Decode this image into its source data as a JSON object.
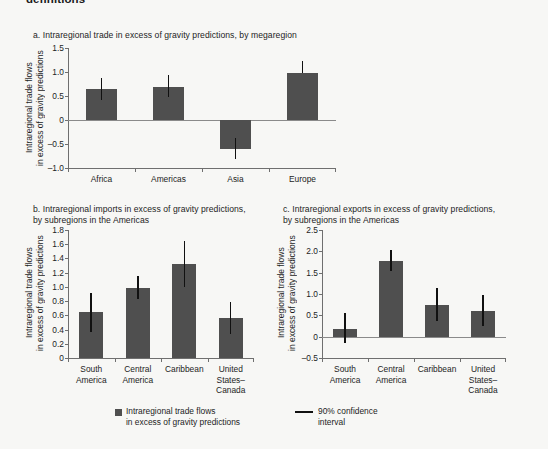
{
  "page": {
    "clipped_heading": "definitions",
    "background": "#f7f7f5",
    "bar_color": "#4f4f4f",
    "error_color": "#111111",
    "axis_color": "#6f6f6f"
  },
  "legend": {
    "bar_label": "Intraregional trade flows\nin excess of gravity predictions",
    "ci_label": "90% confidence\ninterval",
    "swatch_bar_name": "bar-swatch",
    "swatch_line_name": "ci-line-swatch"
  },
  "chart_data": [
    {
      "id": "a",
      "type": "bar",
      "title": "a. Intraregional trade in excess of gravity predictions, by megaregion",
      "xlabel": "",
      "ylabel": "Intraregional trade flows\nin excess of gravity predictions",
      "categories": [
        "Africa",
        "Americas",
        "Asia",
        "Europe"
      ],
      "values": [
        0.64,
        0.69,
        -0.6,
        0.97
      ],
      "ci_low": [
        0.41,
        0.48,
        -0.82,
        0.97
      ],
      "ci_high": [
        0.88,
        0.93,
        -0.38,
        1.22
      ],
      "yticks": [
        1.5,
        1.0,
        0.5,
        0,
        -0.5,
        -1.0
      ],
      "ytick_labels": [
        "1.5",
        "1.0",
        "0.5",
        "0",
        "–0.5",
        "–1.0"
      ],
      "ylim": [
        -1.0,
        1.5
      ],
      "grid": false,
      "legend_position": "bottom",
      "error_label": "90% confidence interval"
    },
    {
      "id": "b",
      "type": "bar",
      "title": "b. Intraregional imports in excess of gravity predictions,\nby subregions in the Americas",
      "xlabel": "",
      "ylabel": "Intraregional trade flows\nin excess of gravity predictions",
      "categories": [
        "South\nAmerica",
        "Central\nAmerica",
        "Caribbean",
        "United\nStates–\nCanada"
      ],
      "values": [
        0.65,
        0.99,
        1.32,
        0.56
      ],
      "ci_low": [
        0.36,
        0.83,
        1.0,
        0.34
      ],
      "ci_high": [
        0.92,
        1.15,
        1.65,
        0.79
      ],
      "yticks": [
        1.8,
        1.6,
        1.4,
        1.2,
        1.0,
        0.8,
        0.6,
        0.4,
        0.2,
        0
      ],
      "ytick_labels": [
        "1.8",
        "1.6",
        "1.4",
        "1.2",
        "1.0",
        "0.8",
        "0.6",
        "0.4",
        "0.2",
        "0"
      ],
      "ylim": [
        0,
        1.8
      ],
      "grid": false,
      "legend_position": "bottom",
      "error_label": "90% confidence interval"
    },
    {
      "id": "c",
      "type": "bar",
      "title": "c. Intraregional exports in excess of gravity predictions,\nby subregions in the Americas",
      "xlabel": "",
      "ylabel": "Intraregional trade flows\nin excess of gravity predictions",
      "categories": [
        "South\nAmerica",
        "Central\nAmerica",
        "Caribbean",
        "United\nStates–\nCanada"
      ],
      "values": [
        0.19,
        1.78,
        0.74,
        0.61
      ],
      "ci_low": [
        -0.14,
        1.53,
        0.36,
        0.24
      ],
      "ci_high": [
        0.55,
        2.04,
        1.15,
        0.98
      ],
      "yticks": [
        2.5,
        2.0,
        1.5,
        1.0,
        0.5,
        0,
        -0.5
      ],
      "ytick_labels": [
        "2.5",
        "2.0",
        "1.5",
        "1.0",
        "0.5",
        "0",
        "–0.5"
      ],
      "ylim": [
        -0.5,
        2.5
      ],
      "grid": false,
      "legend_position": "bottom",
      "error_label": "90% confidence interval"
    }
  ]
}
